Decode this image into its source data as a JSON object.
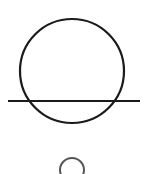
{
  "diagram": {
    "background": "#ffffff",
    "stroke_color": "#1a1a1a",
    "secondary_stroke_color": "#555555",
    "large_circle": {
      "cx": 72,
      "cy": 71,
      "r": 52,
      "stroke_width": 2.2
    },
    "horizontal_line": {
      "x1": 8,
      "y1": 101,
      "x2": 140,
      "y2": 101,
      "stroke_width": 2.2
    },
    "small_circle": {
      "cx": 72,
      "cy": 170,
      "r": 12,
      "stroke_width": 2
    }
  }
}
